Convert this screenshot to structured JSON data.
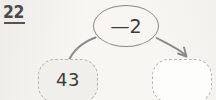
{
  "worksheet": {
    "problem_number": "22",
    "underline_visible": true
  },
  "diagram": {
    "type": "function-machine",
    "operator": {
      "label": "—2",
      "operation": "subtract",
      "operand": "2",
      "shape": "oval"
    },
    "input_box": {
      "value": "43",
      "filled": true,
      "border_style": "dashed"
    },
    "output_box": {
      "value": "",
      "filled": false,
      "border_style": "dashed"
    },
    "arrows": [
      {
        "name": "input-to-operator",
        "has_arrowhead": false,
        "direction": "up-right"
      },
      {
        "name": "operator-to-output",
        "has_arrowhead": true,
        "direction": "down-right"
      }
    ]
  },
  "colors": {
    "background": "#f7f6f3",
    "stroke": "#8b8a88",
    "dashed_border": "#b9b7b3",
    "text": "#3c3b3a",
    "number_text": "#4a4a4a",
    "input_fill": "#f0efec",
    "output_fill": "#fdfdfc"
  }
}
